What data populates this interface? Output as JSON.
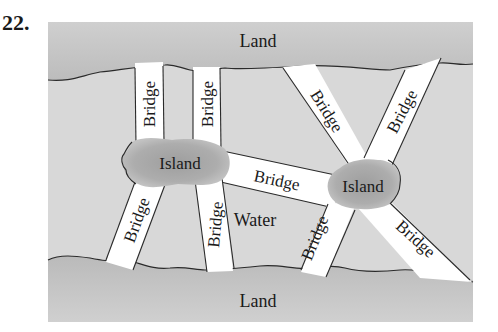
{
  "problem_number": "22.",
  "labels": {
    "land_top": "Land",
    "land_bottom": "Land",
    "water": "Water",
    "island_left": "Island",
    "island_right": "Island",
    "bridge": "Bridge"
  },
  "bridges": [
    {
      "id": "top-left-1",
      "label": "Bridge",
      "connects": [
        "Land (top)",
        "Island (left)"
      ]
    },
    {
      "id": "top-left-2",
      "label": "Bridge",
      "connects": [
        "Land (top)",
        "Island (left)"
      ]
    },
    {
      "id": "top-right-1",
      "label": "Bridge",
      "connects": [
        "Land (top)",
        "Island (right)"
      ]
    },
    {
      "id": "top-right-2",
      "label": "Bridge",
      "connects": [
        "Land (top)",
        "Island (right)"
      ]
    },
    {
      "id": "middle",
      "label": "Bridge",
      "connects": [
        "Island (left)",
        "Island (right)"
      ]
    },
    {
      "id": "bottom-left-1",
      "label": "Bridge",
      "connects": [
        "Island (left)",
        "Land (bottom)"
      ]
    },
    {
      "id": "bottom-left-2",
      "label": "Bridge",
      "connects": [
        "Island (left)",
        "Land (bottom)"
      ]
    },
    {
      "id": "bottom-right-1",
      "label": "Bridge",
      "connects": [
        "Island (right)",
        "Land (bottom)"
      ]
    },
    {
      "id": "bottom-right-2",
      "label": "Bridge",
      "connects": [
        "Island (right)",
        "Land (bottom)"
      ]
    }
  ],
  "colors": {
    "land": "#c4c4c4",
    "water": "#d6d6d6",
    "island": "#a9a9a9",
    "bridge": "#ffffff",
    "outline": "#2a2a2a"
  }
}
